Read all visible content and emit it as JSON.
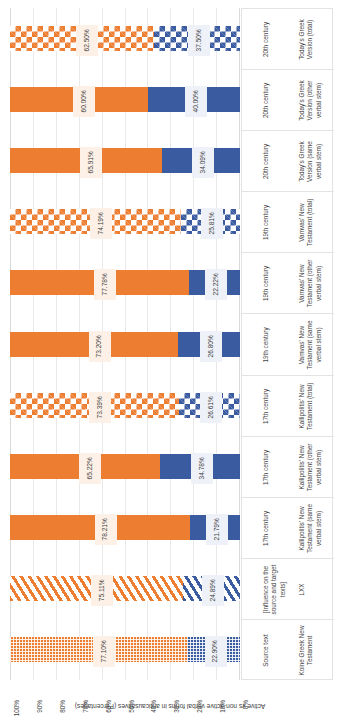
{
  "chart_data": {
    "type": "bar",
    "subtype": "100% stacked horizontal bar",
    "title": "",
    "axis_title": "Active vs non-active verbal forms in anticausatives (Percentages)",
    "xlabel": "",
    "ylabel": "Active vs non-active verbal forms in anticausatives (Percentages)",
    "ylim": [
      0,
      100
    ],
    "grid": true,
    "legend_position": "none",
    "tick_labels": [
      "100%",
      "90%",
      "80%",
      "70%",
      "60%",
      "50%",
      "40%",
      "30%",
      "20%",
      "10%",
      "0%"
    ],
    "axis_direction": "100% at left edge, 0% at right edge",
    "categories": [
      "Koine Greek New Testament",
      "LXX",
      "Kallipolitis' New Testament (same verbal stem)",
      "Kallipolitis' New Testament (other verbal stem)",
      "Kallipolitis' New Testament (total)",
      "Vamvas' New Testament (same verbal stem)",
      "Vamvas' New Testament (other verbal stem)",
      "Vamvas' New Testament (total)",
      "Today's Greek Version (same verbal stem)",
      "Today's Greek Version (other verbal stem)",
      "Today's Greek Version (total)"
    ],
    "group_labels": [
      "Source text",
      "[Influence on the source and target texts]",
      "17th century",
      "17th century",
      "17th century",
      "19th century",
      "19th century",
      "19th century",
      "20th century",
      "20th century",
      "20th century"
    ],
    "series": [
      {
        "name": "Active",
        "color": "#ED7D31",
        "values": [
          77.1,
          75.11,
          78.21,
          65.22,
          73.39,
          73.2,
          77.78,
          74.19,
          65.91,
          60.0,
          62.5
        ],
        "labels": [
          "77.10%",
          "75.11%",
          "78.21%",
          "65.22%",
          "73.39%",
          "73.20%",
          "77.78%",
          "74.19%",
          "65.91%",
          "60.00%",
          "62.50%"
        ]
      },
      {
        "name": "Non-active",
        "color": "#3A5BA0",
        "values": [
          22.9,
          24.89,
          21.79,
          34.78,
          26.61,
          26.8,
          22.22,
          25.81,
          34.09,
          40.0,
          37.5
        ],
        "labels": [
          "22.90%",
          "24.89%",
          "21.79%",
          "34.78%",
          "26.61%",
          "26.80%",
          "22.22%",
          "25.81%",
          "34.09%",
          "40.00%",
          "37.50%"
        ]
      }
    ],
    "bar_fill_patterns": [
      "dot",
      "diag",
      "solid",
      "solid",
      "diamond",
      "solid",
      "solid",
      "diamond",
      "solid",
      "solid",
      "diamond"
    ]
  }
}
